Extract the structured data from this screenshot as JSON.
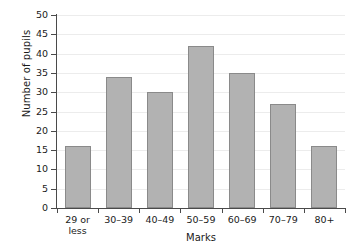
{
  "chart_data": {
    "type": "bar",
    "title": "",
    "xlabel": "Marks",
    "ylabel": "Number of pupils",
    "categories": [
      "29 or less",
      "30–39",
      "40–49",
      "50–59",
      "60–69",
      "70–79",
      "80+"
    ],
    "category_lines": [
      [
        "29 or",
        "less"
      ],
      [
        "30–39"
      ],
      [
        "40–49"
      ],
      [
        "50–59"
      ],
      [
        "60–69"
      ],
      [
        "70–79"
      ],
      [
        "80+"
      ]
    ],
    "values": [
      16,
      34,
      30,
      42,
      35,
      27,
      16
    ],
    "ylim": [
      0,
      50
    ],
    "ytick_step": 5,
    "yticks": [
      0,
      5,
      10,
      15,
      20,
      25,
      30,
      35,
      40,
      45,
      50
    ],
    "grid": true,
    "legend": "none",
    "colors": {
      "bar_fill": "#b2b2b2",
      "bar_stroke": "#8a8a8a",
      "gridline": "#ececec",
      "axis": "#4a4a4a",
      "text": "#1a1a1a",
      "background": "#ffffff"
    }
  }
}
